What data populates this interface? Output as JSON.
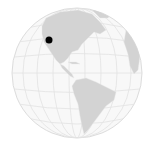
{
  "map": {
    "type": "orthographic-globe",
    "view": "Western Hemisphere",
    "colors": {
      "ocean": "#f8f8f8",
      "land": "#d3d3d3",
      "graticule": "#e2e2e2",
      "outline": "#dcdcdc",
      "marker": "#000000"
    },
    "marker": {
      "label": "location-marker",
      "region": "Western North America"
    }
  }
}
